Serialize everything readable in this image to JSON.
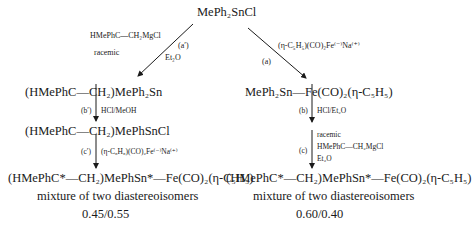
{
  "start": "MePh₂SnCl",
  "left": {
    "reagent_top": "HMePhC—CH₂MgCl",
    "reagent_note": "racemic",
    "step_a_label": "(a′)",
    "step_a_solvent": "Et₂O",
    "product1": "(HMePhC—CH₂)MePh₂Sn",
    "step_b_label": "(b′)",
    "step_b_reagent": "HCl/MeOH",
    "product2": "(HMePhC—CH₂)MePhSnCl",
    "step_c_label": "(c′)",
    "step_c_reagent": "(η-C₅H₅)(CO)₂Fe⁽⁻⁾Na⁽⁺⁾",
    "final_product": "(HMePhC*—CH₂)MePhSn*—Fe(CO)₂(η-C₅H₅)",
    "result_note": "mixture of two diastereoisomers",
    "ratio": "0.45/0.55"
  },
  "right": {
    "step_a_label": "(a)",
    "step_a_reagent": "(η-C₅H₅)(CO)₂Fe⁽⁻⁾Na⁽⁺⁾",
    "product1": "MePh₂Sn—Fe(CO)₂(η-C₅H₅)",
    "step_b_label": "(b)",
    "step_b_reagent": "HCl/Et₂O",
    "step_c_label": "(c)",
    "step_c_note": "racemic",
    "step_c_reagent": "HMePhC—CH₂MgCl",
    "step_c_solvent": "Et₂O",
    "final_product": "(HMePhC*—CH₂)MePhSn*—Fe(CO)₂(η-C₅H₅)",
    "result_note": "mixture of two diastereoisomers",
    "ratio": "0.60/0.40"
  }
}
